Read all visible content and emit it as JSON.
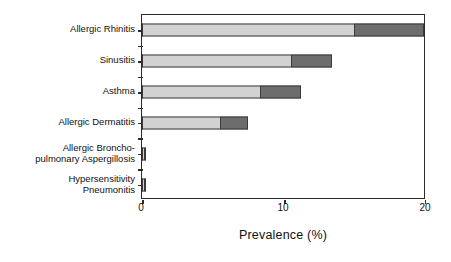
{
  "chart_data": {
    "type": "bar",
    "orientation": "horizontal",
    "stacked": true,
    "title": "",
    "xlabel": "Prevalence (%)",
    "ylabel": "",
    "xlim": [
      0,
      20
    ],
    "xticks": [
      0,
      10,
      20
    ],
    "xticklabels": [
      "0",
      "10",
      "20"
    ],
    "grid": false,
    "legend": null,
    "categories": [
      "Allergic Rhinitis",
      "Sinusitis",
      "Asthma",
      "Allergic Dermatitis",
      "Allergic Broncho-\npulmonary Aspergillosis",
      "Hypersensitivity\nPneumonitis"
    ],
    "series": [
      {
        "name": "light-segment",
        "color": "#d2d2d2",
        "values": [
          15.0,
          10.6,
          8.4,
          5.5,
          0.15,
          0.15
        ]
      },
      {
        "name": "dark-segment",
        "color": "#6d6d6d",
        "values": [
          5.0,
          2.9,
          2.9,
          2.0,
          0.1,
          0.1
        ]
      }
    ],
    "totals": [
      20.0,
      13.5,
      11.3,
      7.5,
      0.25,
      0.25
    ]
  },
  "axis": {
    "frame_color": "#2b2b2b",
    "bar_outline_color": "#3a3a3a"
  }
}
